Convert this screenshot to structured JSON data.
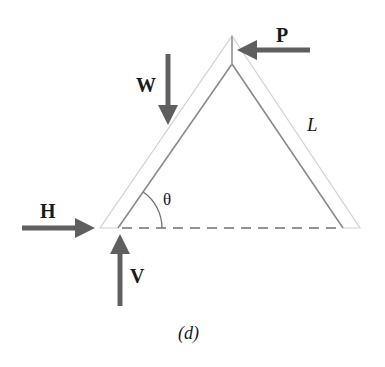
{
  "diagram": {
    "type": "free-body diagram",
    "labels": {
      "P": "P",
      "W": "W",
      "H": "H",
      "V": "V",
      "L": "L",
      "theta": "θ",
      "caption": "(d)"
    },
    "forces": [
      {
        "name": "P",
        "direction": "left",
        "applied_at": "apex"
      },
      {
        "name": "W",
        "direction": "down",
        "applied_at": "left member midspan"
      },
      {
        "name": "H",
        "direction": "right",
        "applied_at": "left base"
      },
      {
        "name": "V",
        "direction": "up",
        "applied_at": "left base"
      }
    ],
    "colors": {
      "arrow": "#5f5f5f",
      "member_line": "#8a8a8a",
      "member_outline": "#cfcfcf",
      "dashed_line": "#707070",
      "text": "#1a1a1a"
    }
  }
}
